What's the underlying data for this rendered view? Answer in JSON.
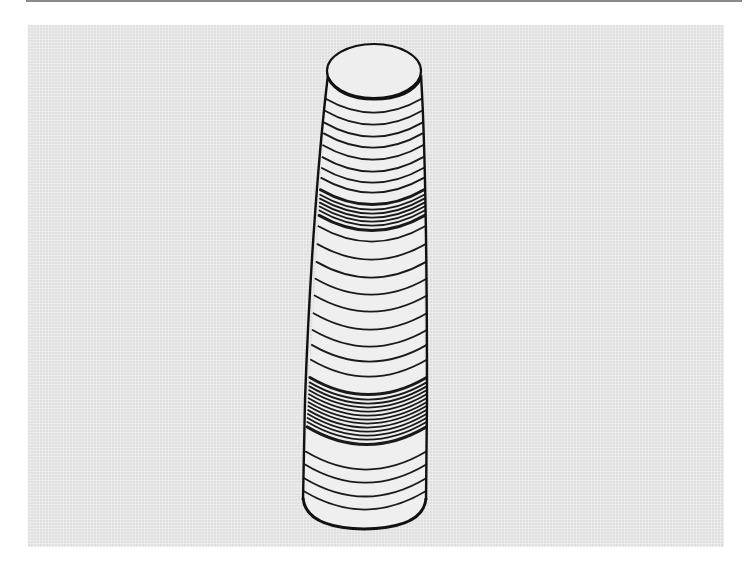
{
  "figure": {
    "colors": {
      "background": "#ffffff",
      "panel": "#ebebeb",
      "stroke": "#1a1a1a",
      "fill": "#efefef",
      "top_rule": "#8a8a8a"
    },
    "top_ellipse": {
      "cx": 374,
      "cy": 71,
      "rx": 47,
      "ry": 27
    },
    "rings": [
      {
        "y": 113,
        "bold": false
      },
      {
        "y": 125,
        "bold": false
      },
      {
        "y": 137,
        "bold": false
      },
      {
        "y": 148,
        "bold": false
      },
      {
        "y": 160,
        "bold": false
      },
      {
        "y": 172,
        "bold": false
      },
      {
        "y": 183,
        "bold": false
      },
      {
        "y": 193,
        "bold": false
      },
      {
        "y": 205,
        "bold": true
      },
      {
        "y": 210,
        "bold": false
      },
      {
        "y": 214,
        "bold": false
      },
      {
        "y": 218,
        "bold": false
      },
      {
        "y": 222,
        "bold": false
      },
      {
        "y": 226,
        "bold": false
      },
      {
        "y": 231,
        "bold": true
      },
      {
        "y": 242,
        "bold": false
      },
      {
        "y": 260,
        "bold": false
      },
      {
        "y": 278,
        "bold": false
      },
      {
        "y": 295,
        "bold": false
      },
      {
        "y": 312,
        "bold": false
      },
      {
        "y": 330,
        "bold": false
      },
      {
        "y": 347,
        "bold": false
      },
      {
        "y": 362,
        "bold": false
      },
      {
        "y": 377,
        "bold": false
      },
      {
        "y": 395,
        "bold": true
      },
      {
        "y": 400,
        "bold": false
      },
      {
        "y": 404,
        "bold": false
      },
      {
        "y": 408,
        "bold": false
      },
      {
        "y": 412,
        "bold": false
      },
      {
        "y": 416,
        "bold": false
      },
      {
        "y": 420,
        "bold": false
      },
      {
        "y": 424,
        "bold": false
      },
      {
        "y": 428,
        "bold": false
      },
      {
        "y": 432,
        "bold": false
      },
      {
        "y": 436,
        "bold": false
      },
      {
        "y": 440,
        "bold": false
      },
      {
        "y": 445,
        "bold": true
      },
      {
        "y": 470,
        "bold": false
      },
      {
        "y": 483,
        "bold": false
      },
      {
        "y": 497,
        "bold": false
      },
      {
        "y": 510,
        "bold": false
      }
    ],
    "bottom_y": 528
  }
}
